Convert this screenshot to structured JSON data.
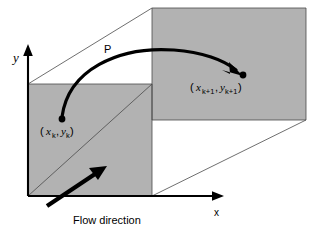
{
  "figure": {
    "type": "diagram",
    "background_color": "#ffffff",
    "face_color": "#b2b2b2",
    "line_color": "#000000",
    "edge_color": "#4a4a4a"
  },
  "axes": {
    "y_label": "y",
    "x_label": "x",
    "origin_label": ""
  },
  "labels": {
    "mapping": "P",
    "flow_direction": "Flow direction",
    "point_start": {
      "open_paren": "(",
      "x_base": "x",
      "x_sub": "k",
      "comma": ",",
      "y_base": "y",
      "y_sub": "k",
      "close_paren": ")",
      "full": "( x_k , y_k )"
    },
    "point_end": {
      "open_paren": "(",
      "x_base": "x",
      "x_sub": "k+1",
      "comma": ",",
      "y_base": "y",
      "y_sub": "k+1",
      "close_paren": ")",
      "full": "( x_k+1 , y_k+1 )"
    }
  },
  "markers": {
    "start_point": {
      "cx": 62,
      "cy": 119,
      "r": 3.4
    },
    "end_point": {
      "cx": 243,
      "cy": 75,
      "r": 3.4
    }
  },
  "geometry": {
    "front_face": "28,84 152,84 152,196 28,196",
    "back_face": "152,8 306,8 306,120 152,120",
    "top_edge_left": "28,84 152,8",
    "bottom_edge_right": "152,196 306,120",
    "front_diag": "28,196 152,84",
    "back_diag_top": "152,8 306,8",
    "y_axis": "28,196 28,50",
    "x_axis": "28,196 222,196"
  },
  "curve": {
    "path": "M 62,119 C 70,72 120,48 175,52 C 205,54 228,62 241,72",
    "arrow_tip": {
      "x": 243,
      "y": 74
    }
  },
  "flow_arrow": {
    "from": {
      "x": 48,
      "y": 205
    },
    "to": {
      "x": 103,
      "y": 168
    }
  }
}
